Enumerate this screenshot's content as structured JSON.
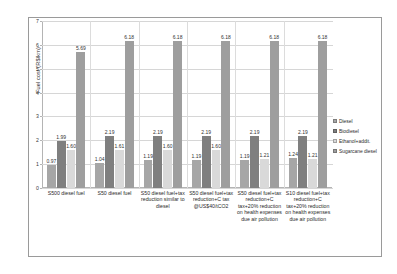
{
  "chart_data": {
    "type": "bar",
    "title": "",
    "xlabel": "",
    "ylabel": "Fuel cost (R$/km)",
    "ylim": [
      0,
      7
    ],
    "yticks": [
      0,
      1,
      2,
      3,
      4,
      5,
      6,
      7
    ],
    "grid": true,
    "legend_position": "right",
    "categories": [
      "S500 diesel fuel",
      "S50 diesel fuel",
      "S50 diesel fuel+tax reduction similar to diesel",
      "S50 diesel fuel+tax reduction+C tax @US$40/tCO2",
      "S50 diesel fuel+tax reduction+C tax+20% reduction on health expenses due air pollution",
      "S10 diesel fuel+tax reduction+C tax+20% reduction on health expenses due air pollution"
    ],
    "series": [
      {
        "name": "Diesel",
        "color": "#a6a6a6",
        "values": [
          0.97,
          1.04,
          1.19,
          1.19,
          1.19,
          1.24
        ],
        "labels": [
          "0.97",
          "1.04",
          "1.19",
          "1.19",
          "1.19",
          "1.24"
        ]
      },
      {
        "name": "Biodiesel",
        "color": "#7f7f7f",
        "values": [
          1.99,
          2.19,
          2.19,
          2.19,
          2.19,
          2.19
        ],
        "labels": [
          "1.99",
          "2.19",
          "2.19",
          "2.19",
          "2.19",
          "2.19"
        ]
      },
      {
        "name": "Ethanol+addit.",
        "color": "#d9d9d9",
        "values": [
          1.6,
          1.61,
          1.6,
          1.6,
          1.21,
          1.21
        ],
        "labels": [
          "1.60",
          "1.61",
          "1.60",
          "1.60",
          "1.21",
          "1.21"
        ]
      },
      {
        "name": "Sugarcane diesel",
        "color": "#9e9e9e",
        "values": [
          5.69,
          6.18,
          6.18,
          6.18,
          6.18,
          6.18
        ],
        "labels": [
          "5.69",
          "6.18",
          "6.18",
          "6.18",
          "6.18",
          "6.18"
        ]
      }
    ]
  },
  "legend": {
    "items": [
      {
        "label": "Diesel",
        "color": "#a6a6a6"
      },
      {
        "label": "Biodiesel",
        "color": "#7f7f7f"
      },
      {
        "label": "Ethanol+addit.",
        "color": "#d9d9d9"
      },
      {
        "label": "Sugarcane diesel",
        "color": "#9e9e9e"
      }
    ]
  },
  "axis": {
    "y_title": "Fuel cost (R$/km)",
    "y_tick_labels": [
      "0",
      "1",
      "2",
      "3",
      "4",
      "5",
      "6",
      "7"
    ]
  }
}
